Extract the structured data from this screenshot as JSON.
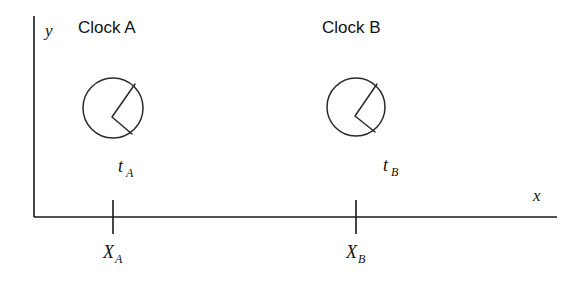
{
  "figure": {
    "background_color": "#ffffff",
    "stroke_color": "#1a1a1a",
    "width": 567,
    "height": 282
  },
  "axes": {
    "x_axis_label": "x",
    "y_axis_label": "y",
    "origin": {
      "x": 34,
      "y": 217
    },
    "x_axis_end": {
      "x": 557,
      "y": 217
    },
    "y_axis_top": {
      "x": 34,
      "y": 16
    }
  },
  "ticks": [
    {
      "id": "tick-a",
      "label_main": "X",
      "label_sub": "A",
      "x": 113,
      "label_x": 105,
      "label_y": 255
    },
    {
      "id": "tick-b",
      "label_main": "X",
      "label_sub": "B",
      "x": 356,
      "label_x": 348,
      "label_y": 255
    }
  ],
  "clocks": [
    {
      "id": "clock-a",
      "title": "Clock A",
      "title_x": 78,
      "title_y": 33,
      "center_x": 113,
      "center_y": 108,
      "radius": 30,
      "hand_vertex": {
        "x": 112,
        "y": 117
      },
      "hand_long_end": {
        "x": 135,
        "y": 84
      },
      "hand_short_end": {
        "x": 132,
        "y": 134
      },
      "time_label_main": "t",
      "time_label_sub": "A",
      "time_label_x": 121,
      "time_label_y": 172
    },
    {
      "id": "clock-b",
      "title": "Clock B",
      "title_x": 322,
      "title_y": 33,
      "center_x": 356,
      "center_y": 107,
      "radius": 29,
      "hand_vertex": {
        "x": 355,
        "y": 116,
        "note": "hands meet here"
      },
      "hand_long_end": {
        "x": 377,
        "y": 84
      },
      "hand_short_end": {
        "x": 375,
        "y": 132
      },
      "time_label_main": "t",
      "time_label_sub": "B",
      "time_label_x": 386,
      "time_label_y": 171
    }
  ]
}
